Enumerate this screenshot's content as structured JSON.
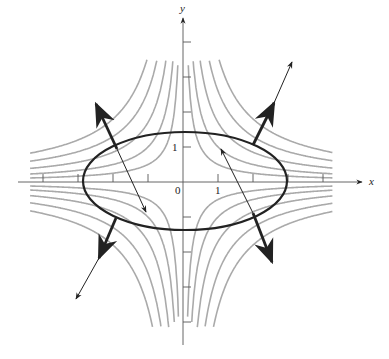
{
  "diagram": {
    "type": "level-curves-with-gradient-vectors",
    "axes": {
      "x_label": "x",
      "y_label": "y",
      "origin_label": "0",
      "x_tick_label": "1",
      "y_tick_label": "1",
      "origin_px": [
        183,
        182
      ],
      "unit_px": 35,
      "x_ticks": [
        -4,
        -3,
        -2,
        -1,
        1,
        2,
        3,
        4
      ],
      "y_ticks": [
        -4,
        -3,
        -2,
        -1,
        1,
        2,
        3,
        4
      ]
    },
    "constraint_curve": {
      "name": "ellipse",
      "center_px": [
        185,
        181
      ],
      "rx_px": 102,
      "ry_px": 49,
      "color": "#222222"
    },
    "level_curves": {
      "family": "xy = c",
      "values": [
        0.5,
        1.0,
        1.7,
        2.6,
        3.6
      ],
      "color": "#aaaaaa"
    },
    "gradient_vectors": [
      {
        "name": "upper-right-thick",
        "from": [
          253,
          145
        ],
        "to": [
          274,
          103
        ],
        "weight": "thick"
      },
      {
        "name": "upper-right-thin",
        "from": [
          274,
          103
        ],
        "to": [
          292,
          62
        ],
        "weight": "thin"
      },
      {
        "name": "upper-left-thick",
        "from": [
          117,
          149
        ],
        "to": [
          96,
          104
        ],
        "weight": "thick"
      },
      {
        "name": "upper-left-thin-inward",
        "from": [
          117,
          149
        ],
        "to": [
          146,
          212
        ],
        "weight": "thin"
      },
      {
        "name": "lower-left-thick",
        "from": [
          116,
          218
        ],
        "to": [
          99,
          258
        ],
        "weight": "thick"
      },
      {
        "name": "lower-left-thin",
        "from": [
          99,
          258
        ],
        "to": [
          76,
          299
        ],
        "weight": "thin"
      },
      {
        "name": "lower-right-thick",
        "from": [
          253,
          213
        ],
        "to": [
          272,
          262
        ],
        "weight": "thick"
      },
      {
        "name": "lower-right-thin-inward",
        "from": [
          253,
          213
        ],
        "to": [
          221,
          149
        ],
        "weight": "thin"
      }
    ]
  }
}
